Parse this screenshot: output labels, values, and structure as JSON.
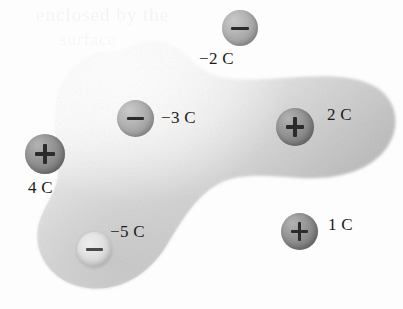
{
  "figure": {
    "background_color": "#fdfdfd"
  },
  "ghost_text": {
    "line_1": "enclosed by the",
    "line_2": "surface",
    "line_3": ""
  },
  "surface": {
    "name": "gaussian-surface",
    "fill_light": "#f4f4f4",
    "fill_mid": "#d8d8d8",
    "fill_dark": "#b6b6b6",
    "edge_color": "#9a9a9a"
  },
  "charges": [
    {
      "id": "charge-neg-2c",
      "label": "−2 C",
      "sign": "−",
      "polarity": "negative",
      "enclosed": false,
      "value": -2,
      "unit": "C",
      "orb_color": "#a3a3a3",
      "x": 222,
      "y": 10,
      "size": 36,
      "label_x": 199,
      "label_y": 49
    },
    {
      "id": "charge-neg-3c",
      "label": "−3 C",
      "sign": "−",
      "polarity": "negative",
      "enclosed": true,
      "value": -3,
      "unit": "C",
      "orb_color": "#a8a8a8",
      "x": 117,
      "y": 100,
      "size": 37,
      "label_x": 161,
      "label_y": 108
    },
    {
      "id": "charge-pos-2c",
      "label": "2 C",
      "sign": "+",
      "polarity": "positive",
      "enclosed": true,
      "value": 2,
      "unit": "C",
      "orb_color": "#858585",
      "x": 276,
      "y": 108,
      "size": 38,
      "label_x": 327,
      "label_y": 105
    },
    {
      "id": "charge-pos-4c",
      "label": "4 C",
      "sign": "+",
      "polarity": "positive",
      "enclosed": false,
      "value": 4,
      "unit": "C",
      "orb_color": "#858585",
      "x": 25,
      "y": 134,
      "size": 40,
      "label_x": 28,
      "label_y": 178
    },
    {
      "id": "charge-neg-5c",
      "label": "−5 C",
      "sign": "−",
      "polarity": "negative",
      "enclosed": true,
      "value": -5,
      "unit": "C",
      "orb_color": "#d8d8d8",
      "x": 77,
      "y": 232,
      "size": 35,
      "label_x": 110,
      "label_y": 222
    },
    {
      "id": "charge-pos-1c",
      "label": "1 C",
      "sign": "+",
      "polarity": "positive",
      "enclosed": false,
      "value": 1,
      "unit": "C",
      "orb_color": "#858585",
      "x": 281,
      "y": 213,
      "size": 37,
      "label_x": 328,
      "label_y": 215
    }
  ]
}
